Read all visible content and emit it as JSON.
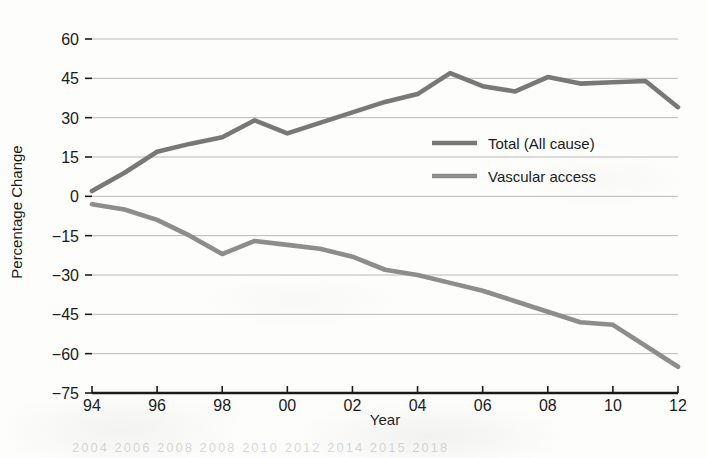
{
  "chart_data": {
    "type": "line",
    "title": "",
    "xlabel": "Year",
    "ylabel": "Percentage Change",
    "xlim": [
      1994,
      2012
    ],
    "ylim": [
      -75,
      60
    ],
    "grid": true,
    "legend_position": "center-right",
    "x": [
      1994,
      1995,
      1996,
      1997,
      1998,
      1999,
      2000,
      2001,
      2002,
      2003,
      2004,
      2005,
      2006,
      2007,
      2008,
      2009,
      2010,
      2011,
      2012
    ],
    "xtick_labels": [
      "94",
      "96",
      "98",
      "00",
      "02",
      "04",
      "06",
      "08",
      "10",
      "12"
    ],
    "xtick_values": [
      1994,
      1996,
      1998,
      2000,
      2002,
      2004,
      2006,
      2008,
      2010,
      2012
    ],
    "ytick_labels": [
      "60",
      "45",
      "30",
      "15",
      "0",
      "−15",
      "−30",
      "−45",
      "−60",
      "−75"
    ],
    "ytick_values": [
      60,
      45,
      30,
      15,
      0,
      -15,
      -30,
      -45,
      -60,
      -75
    ],
    "series": [
      {
        "name": "Total (All cause)",
        "color": "#787878",
        "values": [
          2,
          9,
          17,
          20,
          22.5,
          29,
          24,
          28,
          32,
          36,
          39,
          47,
          42,
          40,
          45.5,
          43,
          43.5,
          44,
          34
        ]
      },
      {
        "name": "Vascular access",
        "color": "#8d8d8d",
        "values": [
          -3,
          -5,
          -9,
          -15,
          -22,
          -17,
          -18.5,
          -20,
          -23,
          -28,
          -30,
          -33,
          -36,
          -40,
          -44,
          -48,
          -49,
          -57,
          -65
        ]
      }
    ]
  },
  "legend": {
    "entries": [
      {
        "label": "Total (All cause)"
      },
      {
        "label": "Vascular access"
      }
    ]
  },
  "axes": {
    "x_title": "Year",
    "y_title": "Percentage Change"
  },
  "ghost_bleed": {
    "bottom_line": "2004 2006 2008 2008 2010 2012 2014 2015 2018",
    "bottom_line_2": "2012 2004 2006 2008 2010 2012 2014 2015"
  }
}
